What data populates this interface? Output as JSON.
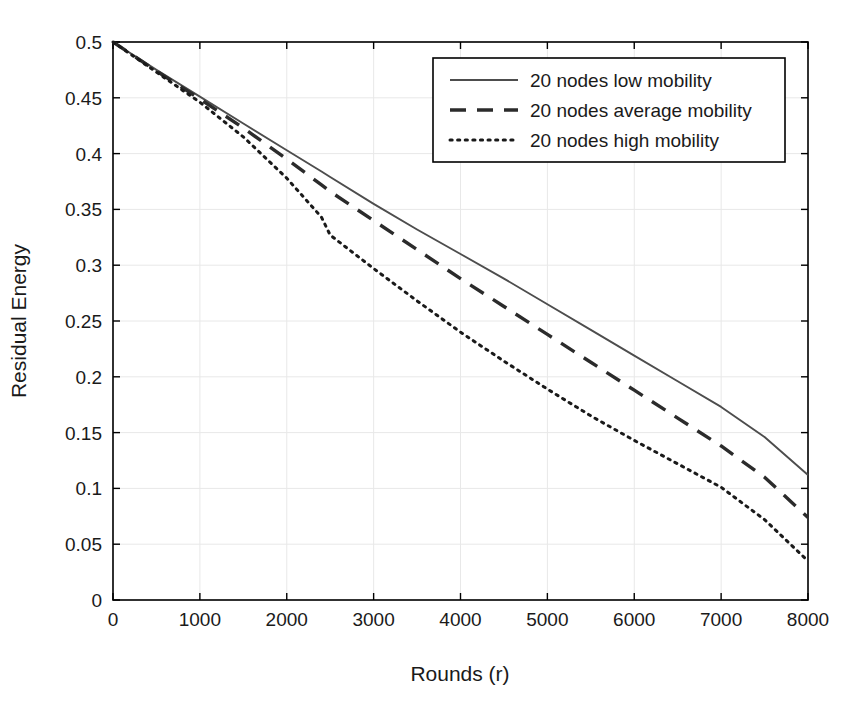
{
  "chart_data": {
    "type": "line",
    "title": "",
    "xlabel": "Rounds (r)",
    "ylabel": "Residual Energy",
    "xlim": [
      0,
      8000
    ],
    "ylim": [
      0,
      0.5
    ],
    "grid": true,
    "legend_position": "top-right",
    "xticks": [
      "0",
      "1000",
      "2000",
      "3000",
      "4000",
      "5000",
      "6000",
      "7000",
      "8000"
    ],
    "xtick_values": [
      0,
      1000,
      2000,
      3000,
      4000,
      5000,
      6000,
      7000,
      8000
    ],
    "yticks": [
      "0",
      "0.05",
      "0.1",
      "0.15",
      "0.2",
      "0.25",
      "0.3",
      "0.35",
      "0.4",
      "0.45",
      "0.5"
    ],
    "ytick_values": [
      0,
      0.05,
      0.1,
      0.15,
      0.2,
      0.25,
      0.3,
      0.35,
      0.4,
      0.45,
      0.5
    ],
    "x": [
      0,
      500,
      1000,
      1500,
      2000,
      2400,
      2500,
      3000,
      3500,
      4000,
      4500,
      5000,
      5500,
      6000,
      6500,
      7000,
      7500,
      8000
    ],
    "series": [
      {
        "name": "20 nodes low mobility",
        "style": "solid",
        "color": "#4d4d4d",
        "values": [
          0.5,
          0.475,
          0.451,
          0.427,
          0.403,
          0.384,
          0.379,
          0.355,
          0.332,
          0.31,
          0.288,
          0.265,
          0.242,
          0.219,
          0.196,
          0.173,
          0.146,
          0.112
        ]
      },
      {
        "name": "20 nodes average mobility",
        "style": "dashed",
        "color": "#2b2b2b",
        "values": [
          0.5,
          0.474,
          0.449,
          0.423,
          0.395,
          0.372,
          0.366,
          0.34,
          0.314,
          0.288,
          0.263,
          0.238,
          0.213,
          0.188,
          0.163,
          0.138,
          0.11,
          0.074
        ]
      },
      {
        "name": "20 nodes high mobility",
        "style": "dotted",
        "color": "#1a1a1a",
        "values": [
          0.5,
          0.473,
          0.446,
          0.415,
          0.378,
          0.343,
          0.327,
          0.297,
          0.268,
          0.24,
          0.214,
          0.189,
          0.165,
          0.143,
          0.122,
          0.101,
          0.072,
          0.035
        ]
      }
    ]
  },
  "style": {
    "background": "#ffffff",
    "axis_color": "#000000",
    "grid_color": "#e8e8e8",
    "legend_border": "#000000"
  }
}
